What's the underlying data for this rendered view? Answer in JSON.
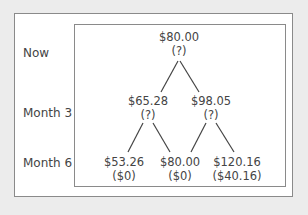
{
  "rows": [
    {
      "label": "Now"
    },
    {
      "label": "Month 3"
    },
    {
      "label": "Month 6"
    }
  ],
  "nodes": {
    "root": {
      "price": "$80.00",
      "value": "(?)"
    },
    "m3_down": {
      "price": "$65.28",
      "value": "(?)"
    },
    "m3_up": {
      "price": "$98.05",
      "value": "(?)"
    },
    "m6_dd": {
      "price": "$53.26",
      "value": "($0)"
    },
    "m6_mid": {
      "price": "$80.00",
      "value": "($0)"
    },
    "m6_uu": {
      "price": "$120.16",
      "value": "($40.16)"
    }
  }
}
